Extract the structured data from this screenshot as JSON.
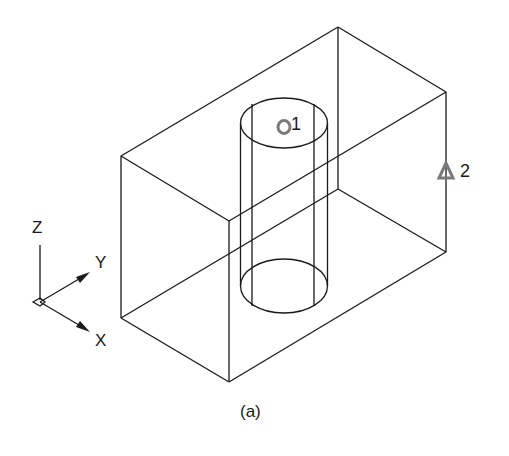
{
  "figure": {
    "caption": "(a)",
    "line_color": "#1a1a1a",
    "marker_color": "#7a7a7a"
  },
  "axes_icon": {
    "z_label": "Z",
    "y_label": "Y",
    "x_label": "X"
  },
  "markers": [
    {
      "id": 1,
      "shape": "circle",
      "label": "1"
    },
    {
      "id": 2,
      "shape": "triangle",
      "label": "2"
    }
  ]
}
